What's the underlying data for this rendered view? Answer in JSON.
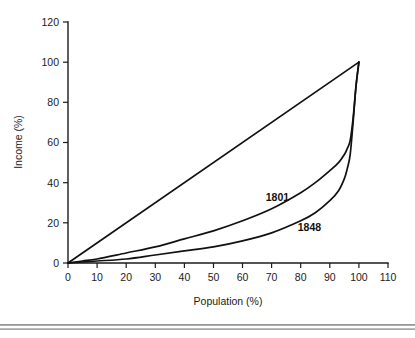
{
  "chart_data": {
    "type": "line",
    "title": "",
    "xlabel": "Population (%)",
    "ylabel": "Income (%)",
    "xlim": [
      0,
      110
    ],
    "ylim": [
      0,
      120
    ],
    "xticks": [
      0,
      10,
      20,
      30,
      40,
      50,
      60,
      70,
      80,
      90,
      100,
      110
    ],
    "yticks": [
      0,
      20,
      40,
      60,
      80,
      100,
      120
    ],
    "grid": false,
    "legend_position": "inline-annotations",
    "annotations": [
      {
        "text": "1801",
        "x": 72,
        "y": 33
      },
      {
        "text": "1848",
        "x": 83,
        "y": 18
      }
    ],
    "series": [
      {
        "name": "line of equality",
        "labelled": false,
        "color": "#111111",
        "x": [
          0,
          100
        ],
        "y": [
          0,
          100
        ]
      },
      {
        "name": "1801",
        "labelled": true,
        "color": "#111111",
        "x": [
          0,
          5,
          10,
          20,
          30,
          40,
          50,
          60,
          70,
          80,
          85,
          90,
          93,
          95,
          96,
          97,
          98,
          99,
          100
        ],
        "y": [
          0,
          1,
          2,
          5,
          8,
          12,
          16,
          21,
          27,
          35,
          40,
          46,
          50,
          54,
          57,
          61,
          72,
          88,
          100
        ]
      },
      {
        "name": "1848",
        "labelled": true,
        "color": "#111111",
        "x": [
          0,
          5,
          10,
          20,
          30,
          40,
          50,
          60,
          70,
          80,
          85,
          90,
          93,
          95,
          96,
          97,
          98,
          99,
          100
        ],
        "y": [
          0,
          0.5,
          1,
          2,
          4,
          6,
          8,
          11,
          15,
          21,
          25,
          31,
          36,
          42,
          47,
          54,
          70,
          88,
          100
        ]
      }
    ]
  },
  "axes": {
    "x_tick_labels": [
      "0",
      "10",
      "20",
      "30",
      "40",
      "50",
      "60",
      "70",
      "80",
      "90",
      "100",
      "110"
    ],
    "y_tick_labels": [
      "0",
      "20",
      "40",
      "60",
      "80",
      "100",
      "120"
    ],
    "x_axis_title": "Population (%)",
    "y_axis_title": "Income (%)"
  },
  "labels": {
    "series_1801": "1801",
    "series_1848": "1848"
  },
  "colors": {
    "line": "#111111",
    "axis": "#1b1b1b",
    "background": "#ffffff",
    "rule": "#9a9a9a"
  }
}
